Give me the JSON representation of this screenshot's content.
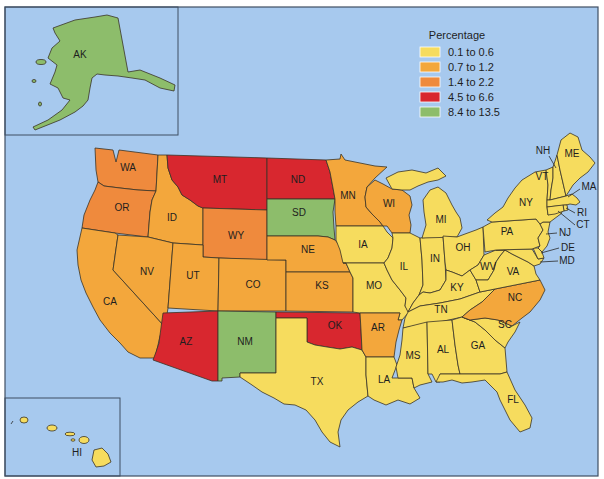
{
  "legend": {
    "title": "Percentage",
    "items": [
      {
        "label": "0.1 to 0.6",
        "color": "#f6dc5e"
      },
      {
        "label": "0.7 to 1.2",
        "color": "#f3a73c"
      },
      {
        "label": "1.4 to 2.2",
        "color": "#ef8a3d"
      },
      {
        "label": "4.5 to 6.6",
        "color": "#d8272f"
      },
      {
        "label": "8.4 to 13.5",
        "color": "#8dbd6b"
      }
    ]
  },
  "colors": {
    "water": "#a7c9ee",
    "state_border": "#3a3426",
    "frame": "#3f4f63"
  },
  "states": {
    "AK": {
      "label": "AK",
      "category": 4
    },
    "HI": {
      "label": "HI",
      "category": 0
    },
    "WA": {
      "label": "WA",
      "category": 2
    },
    "OR": {
      "label": "OR",
      "category": 2
    },
    "CA": {
      "label": "CA",
      "category": 1
    },
    "ID": {
      "label": "ID",
      "category": 1
    },
    "NV": {
      "label": "NV",
      "category": 1
    },
    "MT": {
      "label": "MT",
      "category": 3
    },
    "WY": {
      "label": "WY",
      "category": 2
    },
    "UT": {
      "label": "UT",
      "category": 1
    },
    "CO": {
      "label": "CO",
      "category": 1
    },
    "AZ": {
      "label": "AZ",
      "category": 3
    },
    "NM": {
      "label": "NM",
      "category": 4
    },
    "ND": {
      "label": "ND",
      "category": 3
    },
    "SD": {
      "label": "SD",
      "category": 4
    },
    "NE": {
      "label": "NE",
      "category": 1
    },
    "KS": {
      "label": "KS",
      "category": 1
    },
    "OK": {
      "label": "OK",
      "category": 3
    },
    "TX": {
      "label": "TX",
      "category": 0
    },
    "MN": {
      "label": "MN",
      "category": 1
    },
    "IA": {
      "label": "IA",
      "category": 0
    },
    "MO": {
      "label": "MO",
      "category": 0
    },
    "AR": {
      "label": "AR",
      "category": 1
    },
    "LA": {
      "label": "LA",
      "category": 0
    },
    "WI": {
      "label": "WI",
      "category": 1
    },
    "IL": {
      "label": "IL",
      "category": 0
    },
    "IN": {
      "label": "IN",
      "category": 0
    },
    "MI": {
      "label": "MI",
      "category": 0
    },
    "OH": {
      "label": "OH",
      "category": 0
    },
    "KY": {
      "label": "KY",
      "category": 0
    },
    "TN": {
      "label": "TN",
      "category": 0
    },
    "MS": {
      "label": "MS",
      "category": 0
    },
    "AL": {
      "label": "AL",
      "category": 0
    },
    "GA": {
      "label": "GA",
      "category": 0
    },
    "FL": {
      "label": "FL",
      "category": 0
    },
    "SC": {
      "label": "SC",
      "category": 0
    },
    "NC": {
      "label": "NC",
      "category": 1
    },
    "VA": {
      "label": "VA",
      "category": 0
    },
    "WV": {
      "label": "WV",
      "category": 0
    },
    "PA": {
      "label": "PA",
      "category": 0
    },
    "NY": {
      "label": "NY",
      "category": 0
    },
    "VT": {
      "label": "VT",
      "category": 0
    },
    "NH": {
      "label": "NH",
      "category": 0
    },
    "ME": {
      "label": "ME",
      "category": 0
    },
    "MA": {
      "label": "MA",
      "category": 0
    },
    "RI": {
      "label": "RI",
      "category": 0
    },
    "CT": {
      "label": "CT",
      "category": 0
    },
    "NJ": {
      "label": "NJ",
      "category": 0
    },
    "DE": {
      "label": "DE",
      "category": 0
    },
    "MD": {
      "label": "MD",
      "category": 0
    }
  }
}
